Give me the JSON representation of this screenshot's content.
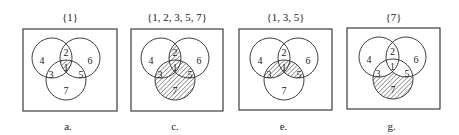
{
  "figure": {
    "panels": [
      {
        "id": "a",
        "title": "{1}",
        "caption": "a.",
        "shaded_regions": [
          1
        ],
        "box": {
          "x": 23,
          "y": 29,
          "w": 94,
          "h": 82
        },
        "circles": {
          "A": [
            52,
            58
          ],
          "B": [
            80,
            58
          ],
          "C": [
            66,
            80
          ],
          "r": 20
        }
      },
      {
        "id": "c",
        "title": "{1, 2, 3, 5, 7}",
        "caption": "c.",
        "shaded_regions": [
          1,
          2,
          3,
          5,
          7
        ],
        "box": {
          "x": 131,
          "y": 29,
          "w": 92,
          "h": 82
        },
        "circles": {
          "A": [
            161,
            58
          ],
          "B": [
            189,
            58
          ],
          "C": [
            175,
            80
          ],
          "r": 20
        }
      },
      {
        "id": "e",
        "title": "{1, 3, 5}",
        "caption": "e.",
        "shaded_regions": [
          1,
          3,
          5
        ],
        "box": {
          "x": 239,
          "y": 29,
          "w": 93,
          "h": 81
        },
        "circles": {
          "A": [
            270,
            58
          ],
          "B": [
            298,
            58
          ],
          "C": [
            284,
            80
          ],
          "r": 20
        }
      },
      {
        "id": "g",
        "title": "{7}",
        "caption": "g.",
        "shaded_regions": [
          7
        ],
        "box": {
          "x": 347,
          "y": 28,
          "w": 93,
          "h": 81
        },
        "circles": {
          "A": [
            379,
            57
          ],
          "B": [
            406,
            57
          ],
          "C": [
            393,
            79
          ],
          "r": 20
        }
      }
    ],
    "region_labels": {
      "r4": "4",
      "r2": "2",
      "r6": "6",
      "r3": "3",
      "r1": "1",
      "r5": "5",
      "r7": "7"
    }
  }
}
